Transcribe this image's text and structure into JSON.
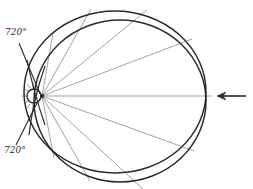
{
  "diagram": {
    "labels": {
      "top_angle": "720°",
      "bottom_angle": "720°"
    },
    "colors": {
      "stroke": "#2a2a2a",
      "ray": "#7a7a7a",
      "background": "#ffffff"
    },
    "elements": {
      "outer_circle": "outer-circle",
      "inner_circle": "inner-circle",
      "small_ellipse": "focal-ellipse",
      "incoming_arrow": "left-pointing-arrow",
      "rays": "ray-fan"
    }
  }
}
